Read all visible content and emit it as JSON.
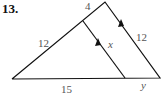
{
  "problem": {
    "number": "13."
  },
  "diagram": {
    "labels": {
      "top_segment": "4",
      "left_side": "12",
      "right_side": "12",
      "inner_segment": "x",
      "base_left": "15",
      "base_right": "y"
    },
    "stroke_color": "#111111",
    "label_color": "#555555"
  }
}
